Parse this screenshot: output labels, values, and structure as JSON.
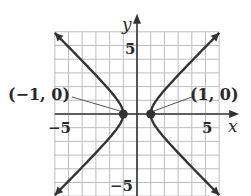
{
  "chart_data": {
    "type": "line",
    "title": "",
    "xlabel": "x",
    "ylabel": "y",
    "xlim": [
      -6,
      6
    ],
    "ylim": [
      -6,
      6
    ],
    "grid": true,
    "x_tick_labels": [
      "-5",
      "5"
    ],
    "y_tick_labels": [
      "5",
      "-5"
    ],
    "series": [
      {
        "name": "right branch",
        "equation": "x^2 - y^2 = 1, x > 0"
      },
      {
        "name": "left branch",
        "equation": "x^2 - y^2 = 1, x < 0"
      }
    ],
    "points": [
      {
        "label": "(−1, 0)",
        "x": -1,
        "y": 0
      },
      {
        "label": "(1, 0)",
        "x": 1,
        "y": 0
      }
    ]
  },
  "labels": {
    "x_axis": "x",
    "y_axis": "y",
    "x_neg": "−5",
    "x_pos": "5",
    "y_pos": "5",
    "y_neg": "−5",
    "vertex_left": "(−1, 0)",
    "vertex_right": "(1, 0)"
  }
}
